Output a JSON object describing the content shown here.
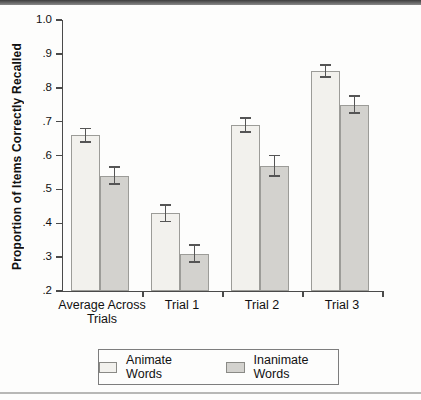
{
  "colors": {
    "animate_fill": "#f2f1ed",
    "inanimate_fill": "#d3d2ce",
    "bar_border": "#9c9c98",
    "axis": "#4a4a4a",
    "error_bar": "#555555",
    "top_band": "#4a4a4a",
    "bottom_rule": "#b8b8b6",
    "legend_border": "#7d7d7d"
  },
  "chart_data": {
    "type": "bar",
    "title": "",
    "xlabel": "",
    "ylabel": "Proportion of Items Correctly Recalled",
    "ylim": [
      0.2,
      1.0
    ],
    "ytick_values": [
      1.0,
      0.9,
      0.8,
      0.7,
      0.6,
      0.5,
      0.4,
      0.3,
      0.2
    ],
    "ytick_labels": [
      "1.0",
      ".9",
      ".8",
      ".7",
      ".6",
      ".5",
      ".4",
      ".3",
      ".2"
    ],
    "categories": [
      "Average Across Trials",
      "Trial 1",
      "Trial 2",
      "Trial 3"
    ],
    "category_display": [
      "Average Across\nTrials",
      "Trial 1",
      "Trial 2",
      "Trial 3"
    ],
    "grid": false,
    "error_bars": true,
    "legend_position": "bottom",
    "series": [
      {
        "name": "Animate Words",
        "values": [
          0.66,
          0.43,
          0.69,
          0.85
        ],
        "errors": [
          0.02,
          0.025,
          0.02,
          0.018
        ],
        "fill": "#f2f1ed"
      },
      {
        "name": "Inanimate Words",
        "values": [
          0.54,
          0.31,
          0.57,
          0.75
        ],
        "errors": [
          0.025,
          0.025,
          0.03,
          0.025
        ],
        "fill": "#d3d2ce"
      }
    ]
  }
}
